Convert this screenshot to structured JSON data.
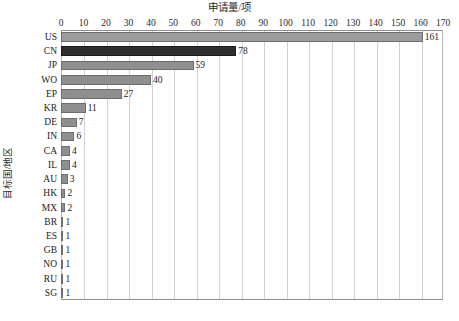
{
  "chart_data": {
    "type": "bar",
    "orientation": "horizontal",
    "title": "申请量/项",
    "xlabel": "",
    "ylabel": "目标国/地区",
    "xlim": [
      0,
      170
    ],
    "xtick_step": 10,
    "xticks": [
      "0",
      "10",
      "20",
      "30",
      "40",
      "50",
      "60",
      "70",
      "80",
      "90",
      "100",
      "110",
      "120",
      "130",
      "140",
      "150",
      "160",
      "170"
    ],
    "grid": "vertical",
    "legend": "none",
    "categories": [
      "US",
      "CN",
      "JP",
      "WO",
      "EP",
      "KR",
      "DE",
      "IN",
      "CA",
      "IL",
      "AU",
      "HK",
      "MX",
      "BR",
      "ES",
      "GB",
      "NO",
      "RU",
      "SG"
    ],
    "values": [
      161,
      78,
      59,
      40,
      27,
      11,
      7,
      6,
      4,
      4,
      3,
      2,
      2,
      1,
      1,
      1,
      1,
      1,
      1
    ],
    "value_labels": [
      "161",
      "78",
      "59",
      "40",
      "27",
      "11",
      "7",
      "6",
      "4",
      "4",
      "3",
      "2",
      "2",
      "1",
      "1",
      "1",
      "1",
      "1",
      "1"
    ],
    "bar_colors": [
      "#9c9c9c",
      "#2e2e2e",
      "#8f8f8f",
      "#8f8f8f",
      "#8f8f8f",
      "#8f8f8f",
      "#8f8f8f",
      "#8f8f8f",
      "#8f8f8f",
      "#8f8f8f",
      "#8f8f8f",
      "#8f8f8f",
      "#8f8f8f",
      "#8f8f8f",
      "#8f8f8f",
      "#8f8f8f",
      "#8f8f8f",
      "#8f8f8f",
      "#8f8f8f"
    ],
    "colors": {
      "axis": "#8d8d8d",
      "grid": "#d2d2d2",
      "text": "#1c1c1c",
      "bar_default": "#8f8f8f",
      "bar_highlight": "#2e2e2e",
      "background": "#ffffff"
    }
  }
}
